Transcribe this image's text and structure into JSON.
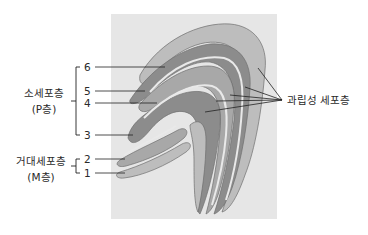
{
  "diagram": {
    "title": "",
    "colors": {
      "background_box": "#e6e6e6",
      "layer_dark": "#8c8c8c",
      "layer_medium": "#a8a8a8",
      "layer_light": "#bdbdbd",
      "granular_gap": "#e9e9e9",
      "outline": "#6e6e6e",
      "leader_line": "#222222"
    },
    "groups": {
      "parvocellular": {
        "name": "소세포층",
        "sub": "(P층)",
        "layers": [
          "6",
          "5",
          "4",
          "3"
        ]
      },
      "magnocellular": {
        "name": "거대세포층",
        "sub": "(M층)",
        "layers": [
          "2",
          "1"
        ]
      }
    },
    "layer_numbers": {
      "l6": "6",
      "l5": "5",
      "l4": "4",
      "l3": "3",
      "l2": "2",
      "l1": "1"
    },
    "granular_label": "과립성 세포층"
  }
}
